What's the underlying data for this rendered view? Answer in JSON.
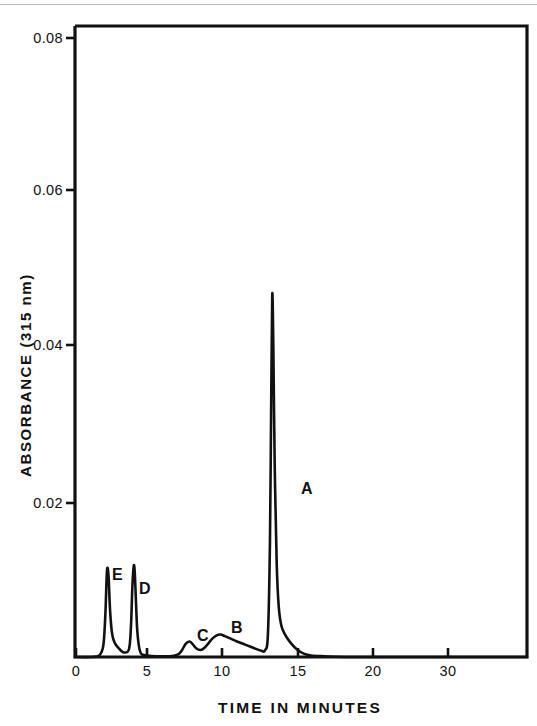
{
  "figure": {
    "background_color": "#ffffff",
    "ink_color": "#111111",
    "scan_edge_color": "#b9b9b9"
  },
  "chart_data": {
    "type": "line",
    "title": "",
    "xlabel": "TIME IN MINUTES",
    "ylabel": "ABSORBANCE (315 nm)",
    "xlim": [
      0,
      33.5
    ],
    "ylim": [
      0,
      0.0815
    ],
    "grid": false,
    "legend": "none",
    "xticks": [
      0,
      5,
      10,
      15,
      20,
      30
    ],
    "xticklabels": [
      "0",
      "5",
      "10",
      "15",
      "20",
      "30"
    ],
    "yticks": [
      0.02,
      0.04,
      0.06,
      0.08
    ],
    "yticklabels": [
      "0.02",
      "0.04",
      "0.06",
      "0.08"
    ],
    "series": [
      {
        "name": "chromatogram",
        "x": [
          0,
          1.2,
          1.8,
          2.1,
          2.25,
          2.35,
          2.42,
          2.5,
          2.6,
          2.75,
          2.95,
          3.2,
          3.6,
          4.0,
          4.15,
          4.25,
          4.35,
          4.42,
          4.5,
          4.6,
          4.72,
          4.85,
          5.0,
          5.3,
          6.0,
          7.0,
          7.6,
          7.9,
          8.2,
          8.5,
          8.75,
          9.0,
          9.3,
          9.6,
          9.9,
          10.2,
          10.5,
          10.8,
          11.1,
          11.5,
          12.0,
          12.6,
          13.2,
          13.8,
          14.1,
          14.3,
          14.45,
          14.55,
          14.62,
          14.7,
          14.8,
          14.95,
          15.1,
          15.3,
          15.6,
          16.0,
          16.5,
          17.0,
          17.5,
          18.5,
          20.0,
          24.0,
          28.0,
          33.5
        ],
        "y": [
          0.0,
          0.0,
          0.0002,
          0.0015,
          0.0055,
          0.0105,
          0.0115,
          0.01,
          0.006,
          0.003,
          0.0018,
          0.0012,
          0.0006,
          0.001,
          0.004,
          0.009,
          0.0117,
          0.0112,
          0.008,
          0.0038,
          0.0016,
          0.0006,
          0.0003,
          0.0002,
          0.0001,
          0.0001,
          0.0003,
          0.0008,
          0.0017,
          0.002,
          0.0016,
          0.0011,
          0.0009,
          0.0012,
          0.0018,
          0.0024,
          0.0028,
          0.0029,
          0.0027,
          0.0024,
          0.002,
          0.0016,
          0.0012,
          0.0008,
          0.0009,
          0.003,
          0.015,
          0.035,
          0.0469,
          0.04,
          0.025,
          0.012,
          0.0065,
          0.004,
          0.0028,
          0.0018,
          0.0009,
          0.0004,
          0.0002,
          0.0001,
          0.0,
          0.0,
          0.0,
          0.0
        ]
      }
    ],
    "annotations": [
      {
        "label": "E",
        "peak_time": 2.42,
        "peak_absorbance": 0.0115,
        "label_x": 2.75,
        "label_y": 0.0122
      },
      {
        "label": "D",
        "peak_time": 4.35,
        "peak_absorbance": 0.0117,
        "label_x": 4.75,
        "label_y": 0.0104
      },
      {
        "label": "C",
        "peak_time": 8.5,
        "peak_absorbance": 0.002,
        "label_x": 8.6,
        "label_y": 0.004
      },
      {
        "label": "B",
        "peak_time": 10.8,
        "peak_absorbance": 0.0029,
        "label_x": 11.0,
        "label_y": 0.0048
      },
      {
        "label": "A",
        "peak_time": 14.62,
        "peak_absorbance": 0.0469,
        "label_x": 15.4,
        "label_y": 0.0222
      }
    ]
  },
  "axes": {
    "x_title": "TIME IN MINUTES",
    "y_title": "ABSORBANCE (315 nm)",
    "x_tick_labels": [
      "0",
      "5",
      "10",
      "15",
      "20",
      "30"
    ],
    "y_tick_labels": [
      "0.02",
      "0.04",
      "0.06",
      "0.08"
    ]
  },
  "peak_labels": {
    "a": "A",
    "b": "B",
    "c": "C",
    "d": "D",
    "e": "E"
  }
}
